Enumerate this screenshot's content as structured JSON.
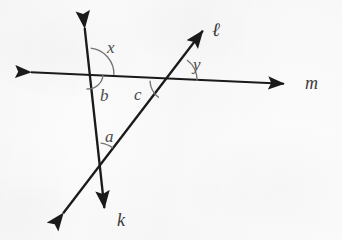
{
  "figure": {
    "type": "geometry-diagram",
    "background_color": "#fbfbfb",
    "stroke_color": "#1a1a1a",
    "arc_color": "#6b6b6b",
    "label_color": "#3c3c3c",
    "lines": [
      {
        "name": "line-m",
        "label": "m",
        "label_x": 312,
        "label_y": 83,
        "x1": 25,
        "y1": 72,
        "x2": 290,
        "y2": 84,
        "arrow_start": true,
        "arrow_end": true,
        "orientation": "horizontal"
      },
      {
        "name": "line-k",
        "label": "k",
        "label_x": 122,
        "label_y": 221,
        "x1": 84,
        "y1": 22,
        "x2": 105,
        "y2": 214,
        "arrow_start": true,
        "arrow_end": true,
        "orientation": "steep-vertical"
      },
      {
        "name": "line-l",
        "label": "ℓ",
        "label_x": 218,
        "label_y": 29,
        "x1": 58,
        "y1": 220,
        "x2": 208,
        "y2": 24,
        "arrow_start": true,
        "arrow_end": true,
        "orientation": "diagonal"
      }
    ],
    "intersections": [
      {
        "name": "k-meets-m",
        "x": 88,
        "y": 74
      },
      {
        "name": "l-meets-m",
        "x": 172,
        "y": 80
      },
      {
        "name": "k-meets-l",
        "x": 98,
        "y": 168
      }
    ],
    "angles": [
      {
        "name": "angle-x",
        "label": "x",
        "label_x": 112,
        "label_y": 48,
        "vertex": "k-meets-m",
        "radius": 26,
        "start_deg": -84,
        "end_deg": 2,
        "sweep_note": "large arc from upward ray of k clockwise to rightward ray of m"
      },
      {
        "name": "angle-b",
        "label": "b",
        "label_x": 104,
        "label_y": 96,
        "vertex": "k-meets-m",
        "radius": 15,
        "start_deg": 2,
        "end_deg": 96,
        "sweep_note": "small arc below m, right of k"
      },
      {
        "name": "angle-c",
        "label": "c",
        "label_x": 139,
        "label_y": 94,
        "vertex": "l-meets-m",
        "radius": 22,
        "start_deg": 127,
        "end_deg": 182,
        "sweep_note": "arc left of l, below m"
      },
      {
        "name": "angle-y",
        "label": "y",
        "label_x": 197,
        "label_y": 64,
        "vertex": "l-meets-m",
        "radius": 25,
        "start_deg": -53,
        "end_deg": 2,
        "sweep_note": "arc between upward ray of l and rightward ray of m"
      },
      {
        "name": "angle-a",
        "label": "a",
        "label_x": 110,
        "label_y": 137,
        "vertex": "k-meets-l",
        "radius": 25,
        "start_deg": -84,
        "end_deg": -53,
        "sweep_note": "arc between upward ray of k and upward ray of l"
      }
    ]
  }
}
